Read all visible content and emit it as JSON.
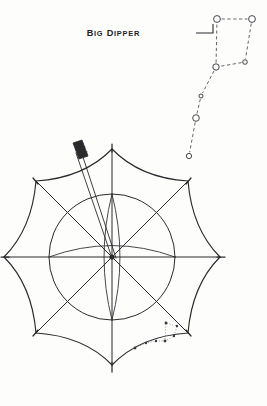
{
  "figure": {
    "background_color": "#fdfdfc",
    "ink_color": "#2a2a2e"
  },
  "annotation": {
    "label": "BIG DIPPER",
    "label_first_letter": "B",
    "label_rest_1": "IG ",
    "label_cap_2": "D",
    "label_rest_2": "IPPER",
    "leader_line": {
      "from_x": 196,
      "from_y": 33,
      "to_x": 215,
      "to_y": 33
    }
  },
  "constellation": {
    "name": "Big Dipper",
    "star_count": 7,
    "style": "open-circles-with-dashed-links",
    "stars": [
      {
        "name": "dubhe",
        "x": 217,
        "y": 19,
        "r": 3.4,
        "part": "bowl"
      },
      {
        "name": "merak",
        "x": 252,
        "y": 19,
        "r": 3.4,
        "part": "bowl"
      },
      {
        "name": "phecda",
        "x": 245,
        "y": 62,
        "r": 2.3,
        "part": "bowl"
      },
      {
        "name": "megrez",
        "x": 216,
        "y": 67,
        "r": 3.2,
        "part": "bowl-handle-junction"
      },
      {
        "name": "alioth",
        "x": 201,
        "y": 96,
        "r": 2.0,
        "part": "handle"
      },
      {
        "name": "mizar",
        "x": 196,
        "y": 118,
        "r": 3.3,
        "part": "handle"
      },
      {
        "name": "alkaid",
        "x": 189,
        "y": 156,
        "r": 2.6,
        "part": "handle"
      }
    ],
    "links": [
      {
        "from": 0,
        "to": 1
      },
      {
        "from": 1,
        "to": 2
      },
      {
        "from": 2,
        "to": 3
      },
      {
        "from": 3,
        "to": 0
      },
      {
        "from": 3,
        "to": 4
      },
      {
        "from": 4,
        "to": 5
      },
      {
        "from": 5,
        "to": 6
      }
    ]
  },
  "umbrella": {
    "view": "top-down",
    "center_x": 112,
    "center_y": 257,
    "rib_count": 8,
    "tip_radius": 108,
    "scallop_depth": 0.78,
    "hub_circle_radius": 63,
    "hub_inner_radius": 7,
    "tips": [
      {
        "index": 0,
        "label": "tip-north",
        "x": 112,
        "y": 149
      },
      {
        "index": 1,
        "label": "tip-northeast",
        "x": 188,
        "y": 181
      },
      {
        "index": 2,
        "label": "tip-east",
        "x": 220,
        "y": 257
      },
      {
        "index": 3,
        "label": "tip-southeast",
        "x": 188,
        "y": 333
      },
      {
        "index": 4,
        "label": "tip-south",
        "x": 112,
        "y": 365
      },
      {
        "index": 5,
        "label": "tip-southwest",
        "x": 36,
        "y": 333
      },
      {
        "index": 6,
        "label": "tip-west",
        "x": 4,
        "y": 257
      },
      {
        "index": 7,
        "label": "tip-northwest",
        "x": 36,
        "y": 181
      }
    ],
    "handle": {
      "name": "umbrella-shaft",
      "tip_x": 74,
      "tip_y": 150,
      "base_x": 114,
      "base_y": 259,
      "width": 4.0,
      "ferrule_length": 16,
      "ferrule_color": "#2a2a2e"
    },
    "fabric_motif": {
      "name": "printed-big-dipper",
      "panel": "lower-right",
      "dot_count": 7,
      "dots": [
        {
          "x": 135,
          "y": 348
        },
        {
          "x": 146,
          "y": 343
        },
        {
          "x": 156,
          "y": 341
        },
        {
          "x": 165,
          "y": 341
        },
        {
          "x": 174,
          "y": 336
        },
        {
          "x": 177,
          "y": 326
        },
        {
          "x": 166,
          "y": 323
        }
      ]
    }
  }
}
